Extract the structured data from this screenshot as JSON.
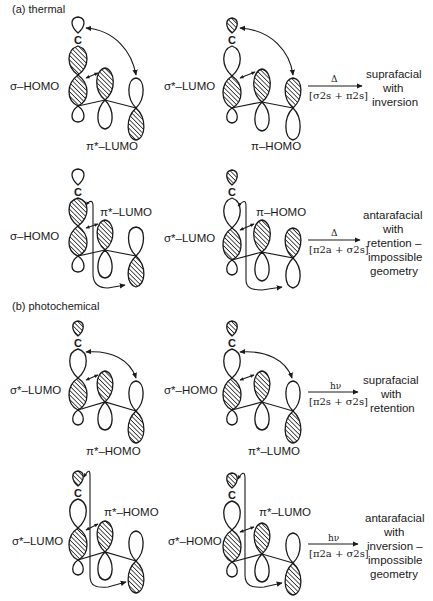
{
  "figure": {
    "sections": [
      {
        "id": "a",
        "label": "(a) thermal",
        "rows": [
          {
            "left": {
              "orbital_label": "σ–HOMO",
              "pi_label": "π*–LUMO",
              "pi_label_position": "below",
              "sigma_lobes": [
                "open",
                "hatched",
                "hatched",
                "open"
              ],
              "pi_lobes": {
                "middle": [
                  "hatched",
                  "open"
                ],
                "right": [
                  "open",
                  "hatched"
                ]
              },
              "interaction": "suprafacial"
            },
            "right": {
              "orbital_label": "σ*–LUMO",
              "pi_label": "π–HOMO",
              "pi_label_position": "below",
              "sigma_lobes": [
                "hatched",
                "open",
                "hatched",
                "open"
              ],
              "pi_lobes": {
                "middle": [
                  "hatched",
                  "open"
                ],
                "right": [
                  "hatched",
                  "open"
                ]
              },
              "interaction": "suprafacial"
            },
            "condition": "Δ",
            "designation": "[σ2s + π2s]",
            "designation_parts": {
              "a": "σ",
              "b": "2",
              "c": "s",
              "d": "π",
              "e": "2",
              "f": "s"
            },
            "result": [
              "suprafacial",
              "with",
              "inversion"
            ]
          },
          {
            "left": {
              "orbital_label": "σ–HOMO",
              "pi_label": "π*–LUMO",
              "pi_label_position": "above",
              "sigma_lobes": [
                "open",
                "hatched",
                "hatched",
                "open"
              ],
              "pi_lobes": {
                "middle": [
                  "hatched",
                  "open"
                ],
                "right": [
                  "open",
                  "hatched"
                ]
              },
              "interaction": "antarafacial"
            },
            "right": {
              "orbital_label": "σ*–LUMO",
              "pi_label": "π–HOMO",
              "pi_label_position": "above",
              "sigma_lobes": [
                "hatched",
                "open",
                "hatched",
                "open"
              ],
              "pi_lobes": {
                "middle": [
                  "hatched",
                  "open"
                ],
                "right": [
                  "hatched",
                  "open"
                ]
              },
              "interaction": "antarafacial"
            },
            "condition": "Δ",
            "designation": "[π2a + σ2s]",
            "result": [
              "antarafacial",
              "with",
              "retention –",
              "impossible",
              "geometry"
            ]
          }
        ]
      },
      {
        "id": "b",
        "label": "(b) photochemical",
        "rows": [
          {
            "left": {
              "orbital_label": "σ*–LUMO",
              "pi_label": "π*–HOMO",
              "pi_label_position": "below",
              "sigma_lobes": [
                "hatched",
                "open",
                "hatched",
                "open"
              ],
              "pi_lobes": {
                "middle": [
                  "hatched",
                  "open"
                ],
                "right": [
                  "open",
                  "hatched"
                ]
              },
              "interaction": "suprafacial"
            },
            "right": {
              "orbital_label": "σ*–HOMO",
              "pi_label": "π*–LUMO",
              "pi_label_position": "below",
              "sigma_lobes": [
                "hatched",
                "open",
                "hatched",
                "open"
              ],
              "pi_lobes": {
                "middle": [
                  "hatched",
                  "open"
                ],
                "right": [
                  "open",
                  "hatched"
                ]
              },
              "interaction": "suprafacial"
            },
            "condition": "hν",
            "designation": "[π2s + σ2s]",
            "result": [
              "suprafacial",
              "with",
              "retention"
            ]
          },
          {
            "left": {
              "orbital_label": "σ*–LUMO",
              "pi_label": "π*–HOMO",
              "pi_label_position": "above",
              "sigma_lobes": [
                "hatched",
                "open",
                "hatched",
                "open"
              ],
              "pi_lobes": {
                "middle": [
                  "hatched",
                  "open"
                ],
                "right": [
                  "open",
                  "hatched"
                ]
              },
              "interaction": "antarafacial"
            },
            "right": {
              "orbital_label": "σ*–HOMO",
              "pi_label": "π*–LUMO",
              "pi_label_position": "above",
              "sigma_lobes": [
                "hatched",
                "open",
                "hatched",
                "open"
              ],
              "pi_lobes": {
                "middle": [
                  "hatched",
                  "open"
                ],
                "right": [
                  "open",
                  "hatched"
                ]
              },
              "interaction": "antarafacial"
            },
            "condition": "hν",
            "designation": "[π2a + σ2s]",
            "result": [
              "antarafacial",
              "with",
              "inversion –",
              "impossible",
              "geometry"
            ]
          }
        ]
      }
    ],
    "atom_label": "C",
    "colors": {
      "ink": "#1a1a1a",
      "background": "#ffffff"
    }
  }
}
